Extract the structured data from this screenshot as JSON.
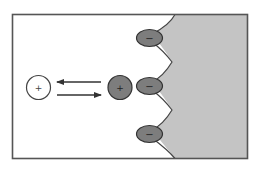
{
  "diagram": {
    "colors": {
      "background": "#ffffff",
      "frame": "#555555",
      "surface_fill": "#c4c4c4",
      "surface_edge": "#444444",
      "bound_ion_fill": "#7d7d7d",
      "free_ion_fill": "#ffffff",
      "arrow": "#333333"
    },
    "free_cation": {
      "sign": "+",
      "label": "free cation in solution"
    },
    "adsorbed_cation": {
      "sign": "+",
      "label": "cation near surface"
    },
    "surface_charges": [
      {
        "sign": "−"
      },
      {
        "sign": "−"
      },
      {
        "sign": "−"
      }
    ],
    "arrows": [
      {
        "direction": "left"
      },
      {
        "direction": "right"
      }
    ]
  }
}
